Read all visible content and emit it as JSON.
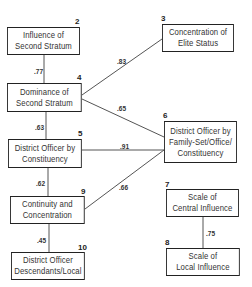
{
  "diagram": {
    "nodes": [
      {
        "id": "2",
        "number": "2",
        "lines": [
          "Influence of",
          "Second Stratum"
        ]
      },
      {
        "id": "3",
        "number": "3",
        "lines": [
          "Concentration of",
          "Elite Status"
        ]
      },
      {
        "id": "4",
        "number": "4",
        "lines": [
          "Dominance of",
          "Second Stratum"
        ]
      },
      {
        "id": "5",
        "number": "5",
        "lines": [
          "District Officer by",
          "Constituency"
        ]
      },
      {
        "id": "6",
        "number": "6",
        "lines": [
          "District Officer by",
          "Family-Set/Office/",
          "Constituency"
        ]
      },
      {
        "id": "7",
        "number": "7",
        "lines": [
          "Scale of",
          "Central Influence"
        ]
      },
      {
        "id": "8",
        "number": "8",
        "lines": [
          "Scale of",
          "Local Influence"
        ]
      },
      {
        "id": "9",
        "number": "9",
        "lines": [
          "Continuity and",
          "Concentration"
        ]
      },
      {
        "id": "10",
        "number": "10",
        "lines": [
          "District Officer",
          "Descendants/Local"
        ]
      }
    ],
    "edges": [
      {
        "from": "2",
        "to": "4",
        "label": ".77"
      },
      {
        "from": "4",
        "to": "3",
        "label": ".83"
      },
      {
        "from": "4",
        "to": "6",
        "label": ".65"
      },
      {
        "from": "4",
        "to": "5",
        "label": ".63"
      },
      {
        "from": "5",
        "to": "6",
        "label": ".91"
      },
      {
        "from": "5",
        "to": "9",
        "label": ".62"
      },
      {
        "from": "9",
        "to": "6",
        "label": ".66"
      },
      {
        "from": "9",
        "to": "10",
        "label": ".45"
      },
      {
        "from": "7",
        "to": "8",
        "label": ".75"
      }
    ]
  }
}
